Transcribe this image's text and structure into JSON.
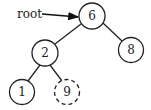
{
  "diagram": {
    "type": "binary-tree",
    "pointer_label": "root",
    "nodes": [
      {
        "id": "n6",
        "label": "6",
        "style": "solid"
      },
      {
        "id": "n2",
        "label": "2",
        "style": "solid"
      },
      {
        "id": "n8",
        "label": "8",
        "style": "solid"
      },
      {
        "id": "n1",
        "label": "1",
        "style": "solid"
      },
      {
        "id": "n9",
        "label": "9",
        "style": "dashed"
      }
    ],
    "edges": [
      {
        "from": "6",
        "to": "2"
      },
      {
        "from": "6",
        "to": "8"
      },
      {
        "from": "2",
        "to": "1"
      },
      {
        "from": "2",
        "to": "9"
      }
    ]
  }
}
